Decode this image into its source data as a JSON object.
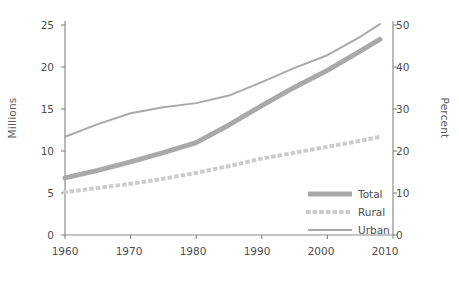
{
  "chart_data": {
    "type": "line",
    "title": "",
    "subtitle": "",
    "xlabel": "",
    "ylabel": "Millions",
    "y2label": "Percent",
    "xlim": [
      1960,
      2010
    ],
    "ylim": [
      0,
      25
    ],
    "y2lim": [
      0,
      50
    ],
    "grid": false,
    "legend_position": "bottom-right-inside",
    "x_ticks": [
      1960,
      1970,
      1980,
      1990,
      2000,
      2010
    ],
    "x_tick_labels": [
      "1960",
      "1970",
      "1980",
      "1990",
      "2000",
      "2010"
    ],
    "y_ticks": [
      0,
      5,
      10,
      15,
      20,
      25
    ],
    "y_tick_labels": [
      "0",
      "5",
      "10",
      "15",
      "20",
      "25"
    ],
    "y2_ticks": [
      0,
      10,
      20,
      30,
      40,
      50
    ],
    "y2_tick_labels": [
      "0",
      "10",
      "20",
      "30",
      "40",
      "50"
    ],
    "x": [
      1960,
      1965,
      1970,
      1975,
      1980,
      1985,
      1990,
      1995,
      2000,
      2005,
      2008
    ],
    "series": [
      {
        "name": "Total",
        "style": "thick-solid",
        "color": "#a9a9a9",
        "width": 5,
        "values": [
          6.8,
          7.7,
          8.7,
          9.8,
          11.0,
          13.1,
          15.4,
          17.6,
          19.6,
          21.9,
          23.3
        ]
      },
      {
        "name": "Rural",
        "style": "dotted",
        "color": "#cccccc",
        "width": 4,
        "values": [
          5.1,
          5.6,
          6.1,
          6.7,
          7.4,
          8.2,
          9.1,
          9.8,
          10.5,
          11.2,
          11.7
        ]
      },
      {
        "name": "Urban",
        "style": "thin-solid",
        "color": "#a9a9a9",
        "width": 2,
        "values": [
          11.7,
          13.2,
          14.5,
          15.2,
          15.7,
          16.6,
          18.2,
          19.9,
          21.4,
          23.6,
          25.1
        ]
      }
    ],
    "axis_color": "#8c8c8c",
    "text_color": "#4d4d4d"
  },
  "legend": {
    "items": [
      {
        "label": "Total",
        "marker": "thick-solid-line-swatch"
      },
      {
        "label": "Rural",
        "marker": "dotted-line-swatch"
      },
      {
        "label": "Urban",
        "marker": "thin-solid-line-swatch"
      }
    ]
  }
}
